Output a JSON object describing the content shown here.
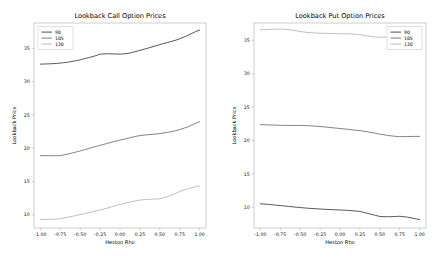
{
  "figure": {
    "background": "#ffffff",
    "width": 439,
    "height": 271
  },
  "chart_data": [
    {
      "type": "line",
      "title": "Lookback Call Option Prices",
      "xlabel": "Heston Rho",
      "ylabel": "Lookback Price",
      "xlim": [
        -1.08,
        1.08
      ],
      "ylim": [
        8.0,
        38.8
      ],
      "xticks": [
        -1.0,
        -0.75,
        -0.5,
        -0.25,
        0.0,
        0.25,
        0.5,
        0.75,
        1.0
      ],
      "xticklabels": [
        "-1.00",
        "-0.75",
        "-0.50",
        "-0.25",
        "0.00",
        "0.25",
        "0.50",
        "0.75",
        "1.00"
      ],
      "yticks": [
        10,
        15,
        20,
        25,
        30,
        35
      ],
      "yticklabels": [
        "10",
        "15",
        "20",
        "25",
        "30",
        "35"
      ],
      "grid": false,
      "legend_position": "upper left",
      "legend_title": "",
      "x": [
        -1.0,
        -0.9,
        -0.8,
        -0.75,
        -0.65,
        -0.55,
        -0.5,
        -0.4,
        -0.3,
        -0.25,
        -0.15,
        -0.05,
        0.0,
        0.1,
        0.2,
        0.25,
        0.35,
        0.45,
        0.5,
        0.6,
        0.7,
        0.75,
        0.85,
        0.95,
        1.0
      ],
      "series": [
        {
          "name": "90",
          "color": "#3b3b3b",
          "values": [
            32.62,
            32.66,
            32.72,
            32.78,
            32.92,
            33.15,
            33.28,
            33.58,
            33.9,
            34.12,
            34.18,
            34.14,
            34.12,
            34.22,
            34.52,
            34.68,
            35.02,
            35.38,
            35.55,
            35.88,
            36.22,
            36.42,
            36.92,
            37.52,
            37.72
          ]
        },
        {
          "name": "105",
          "color": "#6e6e6e",
          "values": [
            18.88,
            18.86,
            18.86,
            18.88,
            19.12,
            19.42,
            19.58,
            19.92,
            20.26,
            20.42,
            20.74,
            21.06,
            21.2,
            21.48,
            21.78,
            21.88,
            22.02,
            22.12,
            22.18,
            22.38,
            22.62,
            22.8,
            23.18,
            23.72,
            23.98
          ]
        },
        {
          "name": "120",
          "color": "#b4b4b4",
          "values": [
            9.28,
            9.3,
            9.34,
            9.4,
            9.62,
            9.88,
            10.0,
            10.28,
            10.58,
            10.72,
            11.02,
            11.38,
            11.52,
            11.82,
            12.1,
            12.2,
            12.3,
            12.36,
            12.38,
            12.72,
            13.22,
            13.5,
            13.88,
            14.2,
            14.32
          ]
        }
      ]
    },
    {
      "type": "line",
      "title": "Lookback Put Option Prices",
      "xlabel": "Heston Rho",
      "ylabel": "Lookback Price",
      "xlim": [
        -1.08,
        1.08
      ],
      "ylim": [
        6.9,
        37.6
      ],
      "xticks": [
        -1.0,
        -0.75,
        -0.5,
        -0.25,
        0.0,
        0.25,
        0.5,
        0.75,
        1.0
      ],
      "xticklabels": [
        "-1.00",
        "-0.75",
        "-0.50",
        "-0.25",
        "0.00",
        "0.25",
        "0.50",
        "0.75",
        "1.00"
      ],
      "yticks": [
        10,
        15,
        20,
        25,
        30,
        35
      ],
      "yticklabels": [
        "10",
        "15",
        "20",
        "25",
        "30",
        "35"
      ],
      "grid": false,
      "legend_position": "upper right",
      "legend_title": "",
      "x": [
        -1.0,
        -0.9,
        -0.8,
        -0.75,
        -0.65,
        -0.55,
        -0.5,
        -0.4,
        -0.3,
        -0.25,
        -0.15,
        -0.05,
        0.0,
        0.1,
        0.2,
        0.25,
        0.35,
        0.45,
        0.5,
        0.6,
        0.7,
        0.75,
        0.85,
        0.95,
        1.0
      ],
      "series": [
        {
          "name": "90",
          "color": "#3b3b3b",
          "values": [
            10.52,
            10.44,
            10.32,
            10.26,
            10.14,
            10.02,
            9.96,
            9.86,
            9.78,
            9.74,
            9.68,
            9.62,
            9.6,
            9.54,
            9.44,
            9.38,
            9.08,
            8.78,
            8.62,
            8.58,
            8.62,
            8.66,
            8.52,
            8.28,
            8.18
          ]
        },
        {
          "name": "105",
          "color": "#6e6e6e",
          "values": [
            22.38,
            22.34,
            22.3,
            22.28,
            22.26,
            22.26,
            22.26,
            22.22,
            22.14,
            22.1,
            21.98,
            21.86,
            21.8,
            21.68,
            21.54,
            21.48,
            21.3,
            21.08,
            20.96,
            20.76,
            20.62,
            20.58,
            20.6,
            20.62,
            20.62
          ]
        },
        {
          "name": "120",
          "color": "#b4b4b4",
          "values": [
            36.58,
            36.62,
            36.68,
            36.7,
            36.62,
            36.42,
            36.32,
            36.18,
            36.1,
            36.08,
            36.04,
            36.0,
            35.98,
            35.98,
            35.92,
            35.86,
            35.66,
            35.5,
            35.46,
            35.52,
            35.54,
            35.48,
            35.28,
            35.32,
            35.42
          ]
        }
      ]
    }
  ]
}
